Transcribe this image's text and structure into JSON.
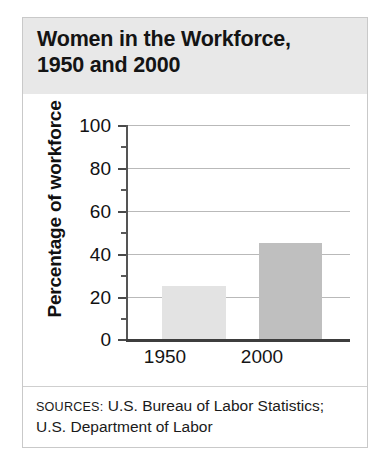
{
  "figure": {
    "title": "Women in the Workforce,\n1950 and 2000",
    "sources_label": "SOURCES:",
    "sources_text": " U.S. Bureau of Labor Statistics; U.S. Department of Labor",
    "frame_border_color": "#c9c9c9",
    "title_band_color": "#e8e8e8"
  },
  "chart_data": {
    "type": "bar",
    "title": "Women in the Workforce, 1950 and 2000",
    "categories": [
      "1950",
      "2000"
    ],
    "values": [
      25,
      45
    ],
    "series": [
      {
        "name": "Percentage of workforce",
        "values": [
          25,
          45
        ],
        "colors": [
          "#e3e3e3",
          "#bfbfbf"
        ]
      }
    ],
    "xlabel": "",
    "ylabel": "Percentage of workforce",
    "ylim": [
      0,
      100
    ],
    "ytick_labels": [
      "0",
      "20",
      "40",
      "60",
      "80",
      "100"
    ],
    "ytick_values": [
      0,
      20,
      40,
      60,
      80,
      100
    ],
    "yminor_tick_values": [
      10,
      30,
      50,
      70,
      90
    ],
    "grid": true,
    "grid_axis": "y",
    "legend": false,
    "legend_position": "none",
    "source": "SOURCES: U.S. Bureau of Labor Statistics; U.S. Department of Labor"
  },
  "axes": {
    "y_title": "Percentage of workforce",
    "y_ticks": [
      {
        "label": "100",
        "value": 100
      },
      {
        "label": "80",
        "value": 80
      },
      {
        "label": "60",
        "value": 60
      },
      {
        "label": "40",
        "value": 40
      },
      {
        "label": "20",
        "value": 20
      },
      {
        "label": "0",
        "value": 0
      }
    ],
    "x_ticks": [
      {
        "label": "1950"
      },
      {
        "label": "2000"
      }
    ]
  }
}
